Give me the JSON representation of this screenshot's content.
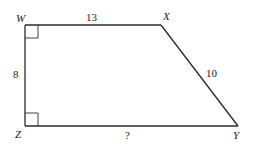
{
  "diagram": {
    "shape": "right trapezoid",
    "vertices": {
      "W": {
        "label": "W"
      },
      "X": {
        "label": "X"
      },
      "Y": {
        "label": "Y"
      },
      "Z": {
        "label": "Z"
      }
    },
    "sides": {
      "WX": {
        "label": "13"
      },
      "XY": {
        "label": "10"
      },
      "WZ": {
        "label": "8"
      },
      "ZY": {
        "label": "?"
      }
    },
    "right_angles": [
      "W",
      "Z"
    ]
  }
}
